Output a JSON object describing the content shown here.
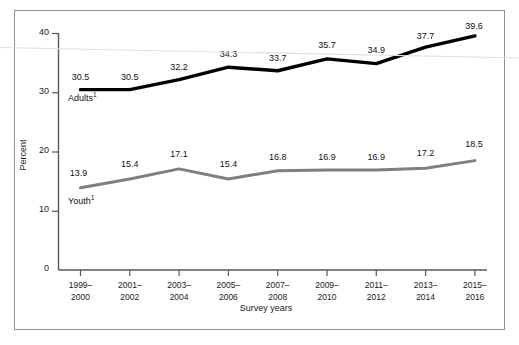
{
  "chart_data": {
    "type": "line",
    "title": "",
    "xlabel": "Survey years",
    "ylabel": "Percent",
    "categories": [
      "1999–\n2000",
      "2001–\n2002",
      "2003–\n2004",
      "2005–\n2006",
      "2007–\n2008",
      "2009–\n2010",
      "2011–\n2012",
      "2013–\n2014",
      "2015–\n2016"
    ],
    "categories_line1": [
      "1999–",
      "2001–",
      "2003–",
      "2005–",
      "2007–",
      "2009–",
      "2011–",
      "2013–",
      "2015–"
    ],
    "categories_line2": [
      "2000",
      "2002",
      "2004",
      "2006",
      "2008",
      "2010",
      "2012",
      "2014",
      "2016"
    ],
    "series": [
      {
        "name": "Adults",
        "name_footnote": "1",
        "color": "#000000",
        "values": [
          30.5,
          30.5,
          32.2,
          34.3,
          33.7,
          35.7,
          34.9,
          37.7,
          39.6
        ],
        "labels": [
          "30.5",
          "30.5",
          "32.2",
          "34.3",
          "33.7",
          "35.7",
          "34.9",
          "37.7",
          "39.6"
        ]
      },
      {
        "name": "Youth",
        "name_footnote": "1",
        "color": "#7f7f7f",
        "values": [
          13.9,
          15.4,
          17.1,
          15.4,
          16.8,
          16.9,
          16.9,
          17.2,
          18.5
        ],
        "labels": [
          "13.9",
          "15.4",
          "17.1",
          "15.4",
          "16.8",
          "16.9",
          "16.9",
          "17.2",
          "18.5"
        ]
      }
    ],
    "ylim": [
      0,
      40
    ],
    "yticks": [
      0,
      10,
      20,
      30,
      40
    ],
    "ytick_labels": [
      "0",
      "10",
      "20",
      "30",
      "40"
    ],
    "grid": false,
    "legend_position": "inline-series-labels"
  },
  "axes": {
    "y_title": "Percent",
    "x_title": "Survey years"
  }
}
